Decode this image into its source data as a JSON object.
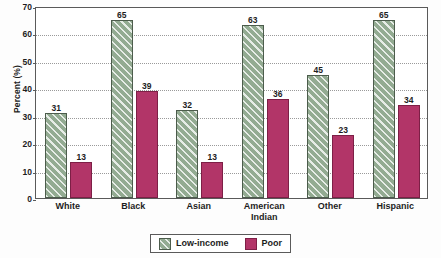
{
  "chart_data": {
    "type": "bar",
    "title": "",
    "xlabel": "",
    "ylabel": "Percent (%)",
    "ylim": [
      0,
      70
    ],
    "ytick_step": 10,
    "yticks": [
      0,
      10,
      20,
      30,
      40,
      50,
      60,
      70
    ],
    "grid": true,
    "grid_axis": "y",
    "legend_position": "bottom-center",
    "categories": [
      "White",
      "Black",
      "Asian",
      "American\nIndian",
      "Other",
      "Hispanic"
    ],
    "series": [
      {
        "name": "Low-income",
        "color": "#93ab92",
        "edge_color": "#4c5c4c",
        "pattern": "diagonal-hatch",
        "values": [
          31,
          65,
          32,
          63,
          45,
          65
        ]
      },
      {
        "name": "Poor",
        "color": "#b23568",
        "edge_color": "#7d1f46",
        "pattern": "solid",
        "values": [
          13,
          39,
          13,
          36,
          23,
          34
        ]
      }
    ]
  },
  "legend": {
    "items": [
      {
        "label": "Low-income"
      },
      {
        "label": "Poor"
      }
    ]
  },
  "axis": {
    "y_title": "Percent (%)"
  },
  "colors": {
    "low_income": "#93ab92",
    "poor": "#b23568",
    "frame": "#5a5a5a",
    "grid": "#9a9a9a",
    "text": "#1d1d1d",
    "background": "#fdfdfd"
  }
}
